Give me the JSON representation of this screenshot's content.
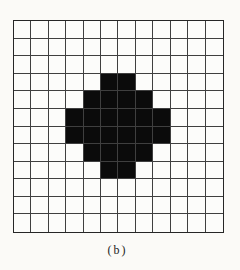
{
  "figure": {
    "caption": "(b)"
  },
  "grid": {
    "rows": 12,
    "cols": 12,
    "line_color": "#3f3f3f",
    "border_color": "#262626",
    "cell_color": "#fcfcfa",
    "fill_color": "#0b0b0b",
    "page_background": "#fbfaf7"
  },
  "chart_data": {
    "type": "heatmap",
    "title": "",
    "caption": "(b)",
    "rows": 12,
    "cols": 12,
    "cell_values": "binary: 1 = black pixel, 0 = white pixel",
    "black_cells": [
      [
        3,
        5
      ],
      [
        3,
        6
      ],
      [
        4,
        4
      ],
      [
        4,
        5
      ],
      [
        4,
        6
      ],
      [
        4,
        7
      ],
      [
        5,
        3
      ],
      [
        5,
        4
      ],
      [
        5,
        5
      ],
      [
        5,
        6
      ],
      [
        5,
        7
      ],
      [
        5,
        8
      ],
      [
        6,
        3
      ],
      [
        6,
        4
      ],
      [
        6,
        5
      ],
      [
        6,
        6
      ],
      [
        6,
        7
      ],
      [
        6,
        8
      ],
      [
        7,
        4
      ],
      [
        7,
        5
      ],
      [
        7,
        6
      ],
      [
        7,
        7
      ],
      [
        8,
        5
      ],
      [
        8,
        6
      ]
    ]
  }
}
